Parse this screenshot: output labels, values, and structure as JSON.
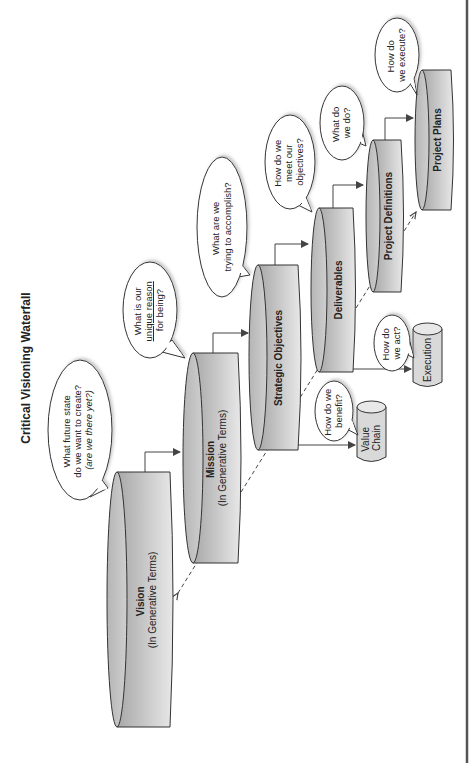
{
  "title": "Critical Visioning Waterfall",
  "colors": {
    "cylinder_dark": "#a8a8a8",
    "cylinder_light": "#e6e6e6",
    "outline": "#333333",
    "border": "#555555"
  },
  "nodes": {
    "vision": {
      "label": "Vision",
      "sub": "(In Generative Terms)"
    },
    "mission": {
      "label": "Mission",
      "sub": "(In Generative Terms)"
    },
    "strategic": {
      "label": "Strategic Objectives"
    },
    "deliverables": {
      "label": "Deliverables"
    },
    "project_definitions": {
      "label": "Project Definitions"
    },
    "project_plans": {
      "label": "Project Plans"
    },
    "value_chain": {
      "line1": "Value",
      "line2": "Chain"
    },
    "execution": {
      "label": "Execution"
    }
  },
  "bubbles": {
    "vision": {
      "line1": "What future state",
      "line2": "do we want to create?",
      "line3": "(are we there yet?)"
    },
    "mission": {
      "line1": "What is our",
      "line2": "unique reason",
      "line3": "for being?"
    },
    "strategic": {
      "line1": "What are we",
      "line2": "trying to accomplish?"
    },
    "deliverables": {
      "line1": "How do we",
      "line2": "meet our",
      "line3": "objectives?"
    },
    "project_definitions": {
      "line1": "What do",
      "line2": "we do?"
    },
    "project_plans": {
      "line1": "How do",
      "line2": "we execute?"
    },
    "value_chain": {
      "line1": "How do we",
      "line2": "benefit?"
    },
    "execution": {
      "line1": "How do",
      "line2": "we act?"
    }
  }
}
